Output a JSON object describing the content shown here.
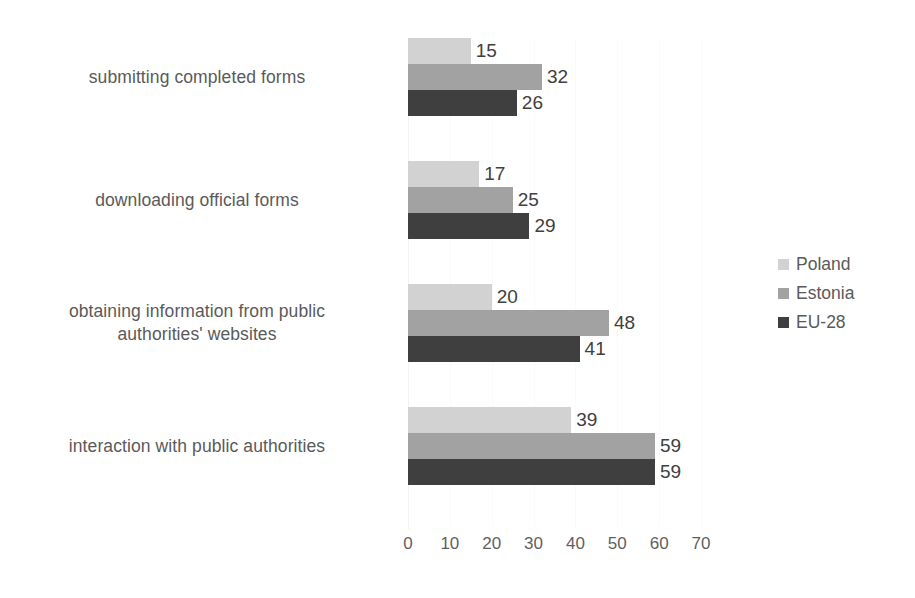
{
  "chart_data": {
    "type": "bar",
    "orientation": "horizontal",
    "title": "",
    "xlabel": "",
    "ylabel": "",
    "xlim": [
      0,
      70
    ],
    "xticks": [
      0,
      10,
      20,
      30,
      40,
      50,
      60,
      70
    ],
    "grid": true,
    "legend_position": "right",
    "categories": [
      "submitting completed forms",
      "downloading official forms",
      "obtaining information from public authorities' websites",
      "interaction with public authorities"
    ],
    "category_lines": [
      [
        "submitting completed forms"
      ],
      [
        "downloading official forms"
      ],
      [
        "obtaining information from public",
        "authorities' websites"
      ],
      [
        "interaction with public authorities"
      ]
    ],
    "series": [
      {
        "name": "Poland",
        "color": "#d2d2d2",
        "values": [
          15,
          17,
          20,
          39
        ]
      },
      {
        "name": "Estonia",
        "color": "#a2a2a2",
        "values": [
          32,
          25,
          48,
          59
        ]
      },
      {
        "name": "EU-28",
        "color": "#3f3f3f",
        "values": [
          26,
          29,
          41,
          59
        ]
      }
    ]
  },
  "legend": {
    "items": [
      {
        "label": "Poland"
      },
      {
        "label": "Estonia"
      },
      {
        "label": "EU-28"
      }
    ]
  }
}
